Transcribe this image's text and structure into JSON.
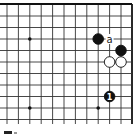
{
  "diagram": {
    "type": "go-board-fragment",
    "colors": {
      "line": "#333333",
      "edge": "#111111",
      "black_stone": "#111111",
      "white_stone": "#ffffff",
      "background": "#ffffff"
    },
    "grid": {
      "columns_x": [
        7,
        18.4,
        29.8,
        41.2,
        52.6,
        64,
        75.4,
        86.8,
        98.2,
        109.6,
        121,
        132
      ],
      "rows_y": [
        4,
        16,
        27.5,
        39,
        50.5,
        62,
        73.5,
        85,
        96.5,
        108,
        119.5
      ],
      "top_edge": true,
      "right_edge": true
    },
    "hoshi": [
      {
        "col": 2,
        "row": 3
      },
      {
        "col": 2,
        "row": 9
      },
      {
        "col": 8,
        "row": 9
      }
    ],
    "stones": [
      {
        "color": "black",
        "col": 8,
        "row": 3,
        "label": ""
      },
      {
        "color": "black",
        "col": 10,
        "row": 4,
        "label": ""
      },
      {
        "color": "white",
        "col": 9,
        "row": 5,
        "label": ""
      },
      {
        "color": "white",
        "col": 10,
        "row": 5,
        "label": ""
      },
      {
        "color": "black",
        "col": 9,
        "row": 8,
        "label": "1"
      }
    ],
    "markers": [
      {
        "text": "a",
        "col": 9,
        "row": 3
      }
    ]
  }
}
